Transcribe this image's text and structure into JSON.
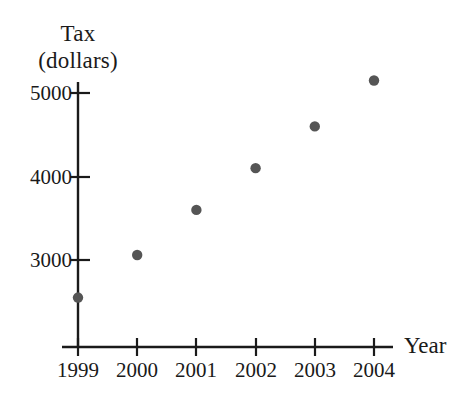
{
  "figure": {
    "background_color": "#ffffff",
    "ink_color": "#1a1a1a",
    "marker_color": "#555555"
  },
  "axes": {
    "y_title_line1": "Tax",
    "y_title_line2": "(dollars)",
    "x_title": "Year",
    "y_ticks": [
      "3000",
      "4000",
      "5000"
    ],
    "x_ticks": [
      "1999",
      "2000",
      "2001",
      "2002",
      "2003",
      "2004"
    ]
  },
  "chart_data": {
    "type": "scatter",
    "title": "",
    "xlabel": "Year",
    "ylabel": "Tax (dollars)",
    "categories": [
      "1999",
      "2000",
      "2001",
      "2002",
      "2003",
      "2004"
    ],
    "x": [
      1999,
      2000,
      2001,
      2002,
      2003,
      2004
    ],
    "values": [
      2550,
      3060,
      3600,
      4100,
      4600,
      5150
    ],
    "points": [
      {
        "year": "1999",
        "tax": 2550
      },
      {
        "year": "2000",
        "tax": 3060
      },
      {
        "year": "2001",
        "tax": 3600
      },
      {
        "year": "2002",
        "tax": 4100
      },
      {
        "year": "2003",
        "tax": 4600
      },
      {
        "year": "2004",
        "tax": 5150
      }
    ],
    "ytick_values": [
      3000,
      4000,
      5000
    ],
    "xtick_values": [
      1999,
      2000,
      2001,
      2002,
      2003,
      2004
    ],
    "ylim": [
      2180,
      5320
    ],
    "xlim": [
      1998.73,
      1998.73
    ],
    "grid": false,
    "legend": null,
    "axis_style": "single-quadrant-with-tick-marks"
  }
}
